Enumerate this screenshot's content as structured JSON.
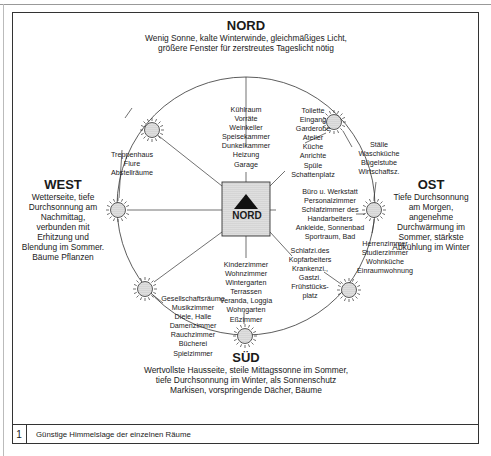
{
  "directions": {
    "north": {
      "title": "NORD",
      "description": "Wenig Sonne, kalte Winterwinde, gleichmäßiges Licht,\ngrößere Fenster für zerstreutes Tageslicht nötig"
    },
    "west": {
      "title": "WEST",
      "description": "Wetterseite, tiefe\nDurchsonnung am\nNachmittag,\nverbunden mit\nErhitzung und\nBlendung im Sommer.\nBäume Pflanzen"
    },
    "east": {
      "title": "OST",
      "description": "Tiefe Durchsonnung\nam Morgen,\nangenehme\nDurchwärmung im\nSommer, stärkste\nAbkühlung im Winter"
    },
    "south": {
      "title": "SÜD",
      "description": "Wertvollste Hausseite, steile Mittagssonne im Sommer,\ntiefe Durchsonnung im Winter, als Sonnenschutz\nMarkisen, vorspringende Dächer, Bäume"
    }
  },
  "center": {
    "label": "NORD",
    "icon": "north-arrow-icon"
  },
  "room_groups": {
    "north": "Kühlraum\nVorräte\nWeinkeller\nSpeisekammer\nDunkelkammer\nHeizung\nGarage",
    "north_east": "Toilette\nEingang\nGarderobe\nAtelier\nKüche\nAnrichte\nSpüle\nSchattenplatz",
    "east_north": "Ställe\nWaschküche\nBügelstube\nWirtschaftsz.",
    "east": "Büro u. Werkstatt\nPersonalzimmer\nSchlafzimmer des\nHandarbeiters\nAnkleide, Sonnenbad\nSportraum, Bad",
    "east_south": "Herrenzimmer\nStudierzimmer\nWohnküche\nEinraumwohnung",
    "south_east": "Schlafzi.des\nKopfarbeiters\nKrankenzi.,\nGastzi.\nFrühstücks-\nplatz",
    "south": "Kinderzimmer\nWohnzimmer\nWintergarten\nTerrassen\nVeranda, Loggia\nWohngarten\nEßzimmer",
    "south_west": "Gesellschaftsräume\nMusikzimmer\nDiele, Halle\nDamenzimmer\nRauchzimmer\nBücherei\nSpielzimmer",
    "west": "Treppenhaus\nFlure\nAbstellräume"
  },
  "caption": {
    "number": "1",
    "text": "Günstige Himmelslage der einzelnen Räume"
  },
  "colors": {
    "line": "#333333",
    "fill_dot": "#d8d8d8",
    "text": "#1a1a1a"
  }
}
